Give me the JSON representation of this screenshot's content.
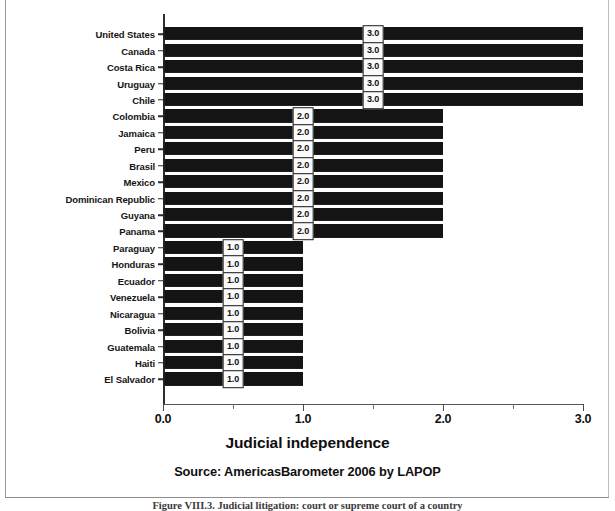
{
  "chart_data": {
    "type": "bar",
    "orientation": "horizontal",
    "title": "",
    "xlabel": "Judicial independence",
    "ylabel": "",
    "xlim": [
      0.0,
      3.0
    ],
    "xticks": [
      "0.0",
      "1.0",
      "2.0",
      "3.0"
    ],
    "xtick_values": [
      0.0,
      1.0,
      2.0,
      3.0
    ],
    "minor_tick_values": [
      0.5,
      1.5,
      2.5
    ],
    "grid": false,
    "legend": null,
    "categories": [
      "United States",
      "Canada",
      "Costa Rica",
      "Uruguay",
      "Chile",
      "Colombia",
      "Jamaica",
      "Peru",
      "Brasil",
      "Mexico",
      "Dominican Republic",
      "Guyana",
      "Panama",
      "Paraguay",
      "Honduras",
      "Ecuador",
      "Venezuela",
      "Nicaragua",
      "Bolivia",
      "Guatemala",
      "Haiti",
      "El Salvador"
    ],
    "values": [
      3.0,
      3.0,
      3.0,
      3.0,
      3.0,
      2.0,
      2.0,
      2.0,
      2.0,
      2.0,
      2.0,
      2.0,
      2.0,
      1.0,
      1.0,
      1.0,
      1.0,
      1.0,
      1.0,
      1.0,
      1.0,
      1.0
    ],
    "value_labels": [
      "3.0",
      "3.0",
      "3.0",
      "3.0",
      "3.0",
      "2.0",
      "2.0",
      "2.0",
      "2.0",
      "2.0",
      "2.0",
      "2.0",
      "2.0",
      "1.0",
      "1.0",
      "1.0",
      "1.0",
      "1.0",
      "1.0",
      "1.0",
      "1.0",
      "1.0"
    ],
    "bar_color": "#141414",
    "source": "Source: AmericasBarometer 2006 by LAPOP"
  },
  "axis": {
    "x_title": "Judicial independence",
    "tick_labels": [
      "0.0",
      "1.0",
      "2.0",
      "3.0"
    ]
  },
  "footer": {
    "source": "Source: AmericasBarometer 2006 by LAPOP",
    "caption": "Figure VIII.3. Judicial litigation: court or supreme court of a country"
  }
}
